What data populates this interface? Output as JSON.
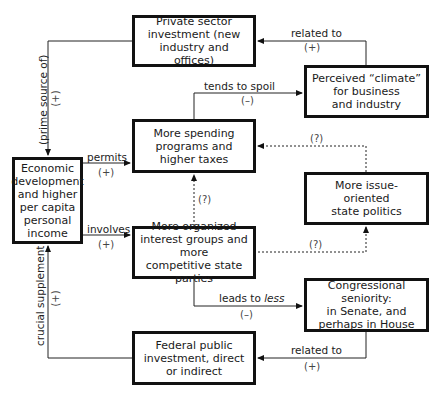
{
  "diagram": {
    "nodes": {
      "private_investment": "Private sector\ninvestment (new\nindustry and offices)",
      "climate": "Perceived “climate”\nfor business\nand industry",
      "spending": "More spending\nprograms and\nhigher taxes",
      "economic": "Economic\ndevelopment\nand higher\nper capita\npersonal\nincome",
      "issue_politics": "More issue-\noriented\nstate politics",
      "organized_groups": "More organized\ninterest groups and more\ncompetitive state parties",
      "seniority": "Congressional seniority:\nin Senate, and\nperhaps in House",
      "federal": "Federal public\ninvestment, direct\nor indirect"
    },
    "edges": {
      "climate_to_private": {
        "label": "related to",
        "sign": "(+)"
      },
      "private_to_economic": {
        "label": "(prime source of)",
        "sign": "(+)"
      },
      "spending_to_climate": {
        "label": "tends to spoil",
        "sign": "(–)"
      },
      "economic_to_spending": {
        "label": "permits",
        "sign": "(+)"
      },
      "issue_to_spending": {
        "label": "",
        "sign": "(?)"
      },
      "organized_to_spending": {
        "label": "",
        "sign": "(?)"
      },
      "economic_to_organized": {
        "label": "involves",
        "sign": "(+)"
      },
      "organized_to_issue": {
        "label": "",
        "sign": "(?)"
      },
      "organized_to_seniority": {
        "label_prefix": "leads to ",
        "label_emph": "less",
        "sign": "(–)"
      },
      "seniority_to_federal": {
        "label": "related to",
        "sign": "(+)"
      },
      "federal_to_economic": {
        "label": "crucial supplement",
        "sign": "(+)"
      }
    }
  }
}
